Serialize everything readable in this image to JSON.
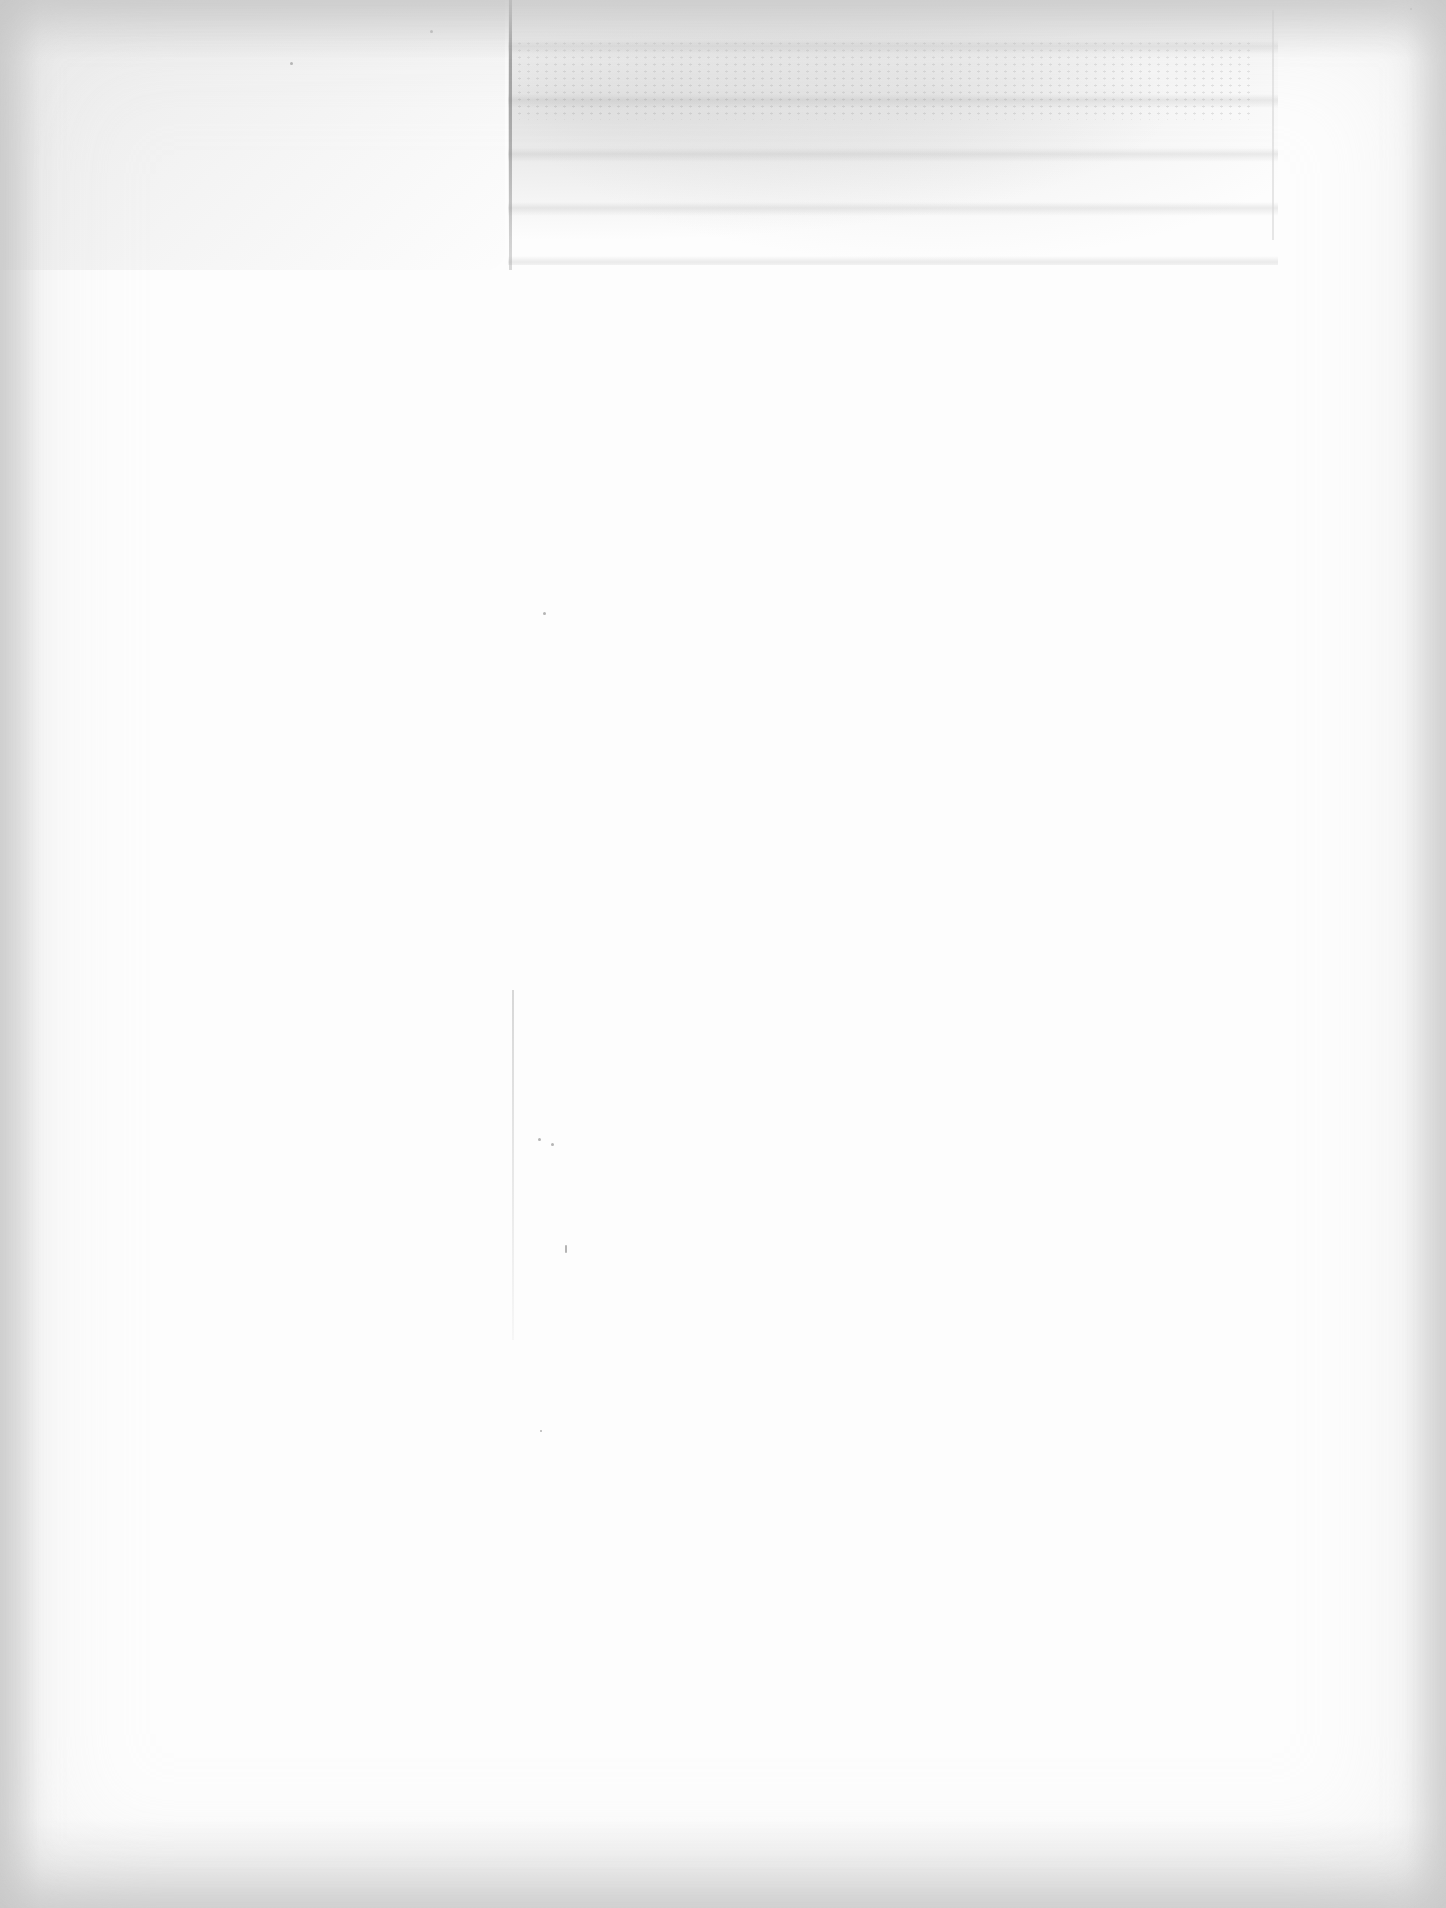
{
  "document": {
    "type": "scanned page",
    "content": "blank page with faint, illegible bleed-through from reverse side",
    "legible_text": []
  },
  "colors": {
    "paper": "#fdfdfd",
    "scan_border": "#c3c3c3",
    "bleed_through": "#969696",
    "edge_line": "#6e6e6e"
  }
}
